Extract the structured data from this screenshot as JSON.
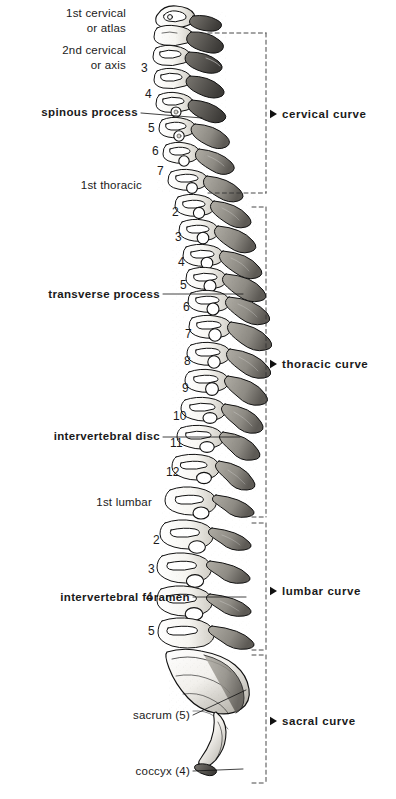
{
  "figure": {
    "ink_color": "#111111",
    "bone_light": "#fdfdfb",
    "bone_mid": "#b9b6ae",
    "bone_dark": "#6f6c66",
    "bracket_color": "#333333"
  },
  "part_labels": [
    {
      "id": "atlas",
      "text": "1st cervical\nor atlas",
      "weight": "plain",
      "align": "right",
      "x": 13,
      "y": 6,
      "width": 113
    },
    {
      "id": "axis",
      "text": "2nd cervical\nor axis",
      "weight": "plain",
      "align": "right",
      "x": 13,
      "y": 43,
      "width": 113
    },
    {
      "id": "spinous-process",
      "text": "spinous process",
      "weight": "bold",
      "align": "right",
      "x": 8,
      "y": 106,
      "width": 130
    },
    {
      "id": "first-thoracic",
      "text": "1st thoracic",
      "weight": "plain",
      "align": "right",
      "x": 40,
      "y": 179,
      "width": 102
    },
    {
      "id": "transverse-process",
      "text": "transverse process",
      "weight": "bold",
      "align": "right",
      "x": 8,
      "y": 288,
      "width": 152
    },
    {
      "id": "intervertebral-disc",
      "text": "intervertebral disc",
      "weight": "bold",
      "align": "right",
      "x": 8,
      "y": 430,
      "width": 152
    },
    {
      "id": "first-lumbar",
      "text": "1st lumbar",
      "weight": "plain",
      "align": "right",
      "x": 48,
      "y": 496,
      "width": 104
    },
    {
      "id": "intervertebral-foramen",
      "text": "intervertebral foramen",
      "weight": "bold",
      "align": "right",
      "x": 4,
      "y": 591,
      "width": 186
    },
    {
      "id": "sacrum",
      "text": "sacrum (5)",
      "weight": "plain",
      "align": "right",
      "x": 85,
      "y": 709,
      "width": 105
    },
    {
      "id": "coccyx",
      "text": "coccyx (4)",
      "weight": "plain",
      "align": "right",
      "x": 85,
      "y": 765,
      "width": 105
    }
  ],
  "vertebra_numbers": [
    {
      "id": "c3",
      "text": "3",
      "x": 141,
      "y": 62
    },
    {
      "id": "c4",
      "text": "4",
      "x": 145,
      "y": 88
    },
    {
      "id": "c5",
      "text": "5",
      "x": 148,
      "y": 122
    },
    {
      "id": "c6",
      "text": "6",
      "x": 152,
      "y": 145
    },
    {
      "id": "c7",
      "text": "7",
      "x": 157,
      "y": 165
    },
    {
      "id": "t2",
      "text": "2",
      "x": 172,
      "y": 206
    },
    {
      "id": "t3",
      "text": "3",
      "x": 175,
      "y": 231
    },
    {
      "id": "t4",
      "text": "4",
      "x": 178,
      "y": 256
    },
    {
      "id": "t5",
      "text": "5",
      "x": 180,
      "y": 279
    },
    {
      "id": "t6",
      "text": "6",
      "x": 183,
      "y": 301
    },
    {
      "id": "t7",
      "text": "7",
      "x": 185,
      "y": 328
    },
    {
      "id": "t8",
      "text": "8",
      "x": 184,
      "y": 355
    },
    {
      "id": "t9",
      "text": "9",
      "x": 182,
      "y": 382
    },
    {
      "id": "t10",
      "text": "10",
      "x": 173,
      "y": 410
    },
    {
      "id": "t11",
      "text": "11",
      "x": 170,
      "y": 437
    },
    {
      "id": "t12",
      "text": "12",
      "x": 166,
      "y": 466
    },
    {
      "id": "l2",
      "text": "2",
      "x": 153,
      "y": 534
    },
    {
      "id": "l3",
      "text": "3",
      "x": 148,
      "y": 563
    },
    {
      "id": "l4",
      "text": "4",
      "x": 146,
      "y": 591
    },
    {
      "id": "l5",
      "text": "5",
      "x": 148,
      "y": 625
    }
  ],
  "curve_brackets": [
    {
      "id": "cervical",
      "label": "cervical curve",
      "top": 33,
      "bottom": 193,
      "label_y": 108,
      "left": 208
    },
    {
      "id": "thoracic",
      "label": "thoracic curve",
      "top": 207,
      "bottom": 517,
      "label_y": 358,
      "left": 252
    },
    {
      "id": "lumbar",
      "label": "lumbar curve",
      "top": 523,
      "bottom": 650,
      "label_y": 585,
      "left": 252
    },
    {
      "id": "sacral",
      "label": "sacral curve",
      "top": 655,
      "bottom": 783,
      "label_y": 715,
      "left": 252
    }
  ],
  "leader_lines": [
    {
      "id": "spinous-process-leader",
      "x1": 141,
      "y1": 113,
      "x2": 202,
      "y2": 118
    },
    {
      "id": "transverse-process-leader",
      "x1": 163,
      "y1": 294,
      "x2": 243,
      "y2": 294
    },
    {
      "id": "intervertebral-disc-leader",
      "x1": 163,
      "y1": 437,
      "x2": 240,
      "y2": 437
    },
    {
      "id": "intervertebral-foramen-leader",
      "x1": 193,
      "y1": 597,
      "x2": 246,
      "y2": 597
    },
    {
      "id": "sacrum-leader",
      "x1": 193,
      "y1": 715,
      "x2": 246,
      "y2": 690
    },
    {
      "id": "coccyx-leader",
      "x1": 193,
      "y1": 771,
      "x2": 243,
      "y2": 769
    }
  ]
}
